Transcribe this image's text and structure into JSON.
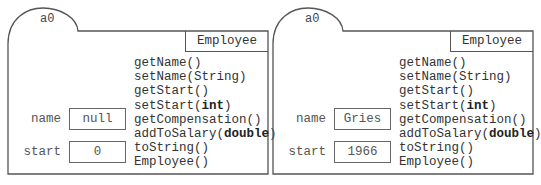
{
  "objects": [
    {
      "name": "a0",
      "class_name": "Employee",
      "fields": [
        {
          "label": "name",
          "value": "null"
        },
        {
          "label": "start",
          "value": "0"
        },
        {
          "label": "salary",
          "value": "50000."
        }
      ],
      "methods": [
        {
          "pre": "getName()",
          "kw": "",
          "post": ""
        },
        {
          "pre": "setName(String)",
          "kw": "",
          "post": ""
        },
        {
          "pre": "getStart()",
          "kw": "",
          "post": ""
        },
        {
          "pre": "setStart(",
          "kw": "int",
          "post": ")"
        },
        {
          "pre": "getCompensation()",
          "kw": "",
          "post": ""
        },
        {
          "pre": "addToSalary(",
          "kw": "double",
          "post": ")"
        },
        {
          "pre": "toString()",
          "kw": "",
          "post": ""
        },
        {
          "pre": "Employee()",
          "kw": "",
          "post": ""
        }
      ]
    },
    {
      "name": "a0",
      "class_name": "Employee",
      "fields": [
        {
          "label": "name",
          "value": "Gries"
        },
        {
          "label": "start",
          "value": "1966"
        },
        {
          "label": "salary",
          "value": "50000."
        }
      ],
      "methods": [
        {
          "pre": "getName()",
          "kw": "",
          "post": ""
        },
        {
          "pre": "setName(String)",
          "kw": "",
          "post": ""
        },
        {
          "pre": "getStart()",
          "kw": "",
          "post": ""
        },
        {
          "pre": "setStart(",
          "kw": "int",
          "post": ")"
        },
        {
          "pre": "getCompensation()",
          "kw": "",
          "post": ""
        },
        {
          "pre": "addToSalary(",
          "kw": "double",
          "post": ")"
        },
        {
          "pre": "toString()",
          "kw": "",
          "post": ""
        },
        {
          "pre": "Employee()",
          "kw": "",
          "post": ""
        }
      ]
    }
  ],
  "colors": {
    "stroke": "#555555",
    "text": "#333333"
  }
}
